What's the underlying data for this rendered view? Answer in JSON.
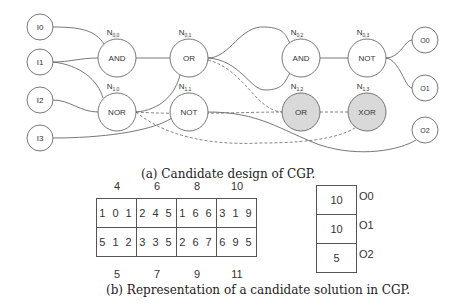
{
  "diagram": {
    "inputs": [
      {
        "label": "I0",
        "x": 40,
        "y": 27
      },
      {
        "label": "I1",
        "x": 40,
        "y": 62
      },
      {
        "label": "I2",
        "x": 40,
        "y": 100
      },
      {
        "label": "I3",
        "x": 40,
        "y": 138
      }
    ],
    "nodes": [
      {
        "id": "N0,0",
        "sub": "0,0",
        "func": "AND",
        "x": 117,
        "y": 58,
        "active": false
      },
      {
        "id": "N0,1",
        "sub": "0,1",
        "func": "OR",
        "x": 189,
        "y": 58,
        "active": false
      },
      {
        "id": "N0,2",
        "sub": "0,2",
        "func": "AND",
        "x": 301,
        "y": 58,
        "active": false
      },
      {
        "id": "N0,3",
        "sub": "0,3",
        "func": "NOT",
        "x": 367,
        "y": 58,
        "active": false
      },
      {
        "id": "N1,0",
        "sub": "1,0",
        "func": "NOR",
        "x": 117,
        "y": 112,
        "active": false
      },
      {
        "id": "N1,1",
        "sub": "1,1",
        "func": "NOT",
        "x": 189,
        "y": 112,
        "active": false
      },
      {
        "id": "N1,2",
        "sub": "1,2",
        "func": "OR",
        "x": 301,
        "y": 112,
        "active": true
      },
      {
        "id": "N1,3",
        "sub": "1,3",
        "func": "XOR",
        "x": 367,
        "y": 112,
        "active": true
      }
    ],
    "outputs": [
      {
        "label": "O0",
        "x": 425,
        "y": 40
      },
      {
        "label": "O1",
        "x": 425,
        "y": 88
      },
      {
        "label": "O2",
        "x": 425,
        "y": 130
      }
    ],
    "colors": {
      "stroke": "#555555",
      "inactive_fill": "#d9d9d9",
      "text": "#333333"
    }
  },
  "caption_a": "(a) Candidate design of CGP.",
  "genome": {
    "top_labels": [
      "4",
      "6",
      "8",
      "10"
    ],
    "rows": [
      [
        "1 0 1",
        "2 4 5",
        "1 6 6",
        "3 1 9"
      ],
      [
        "5 1 2",
        "3 3 5",
        "2 6 7",
        "6 9 5"
      ]
    ],
    "bottom_labels": [
      "5",
      "7",
      "9",
      "11"
    ]
  },
  "output_genes": [
    {
      "value": "10",
      "label": "O0"
    },
    {
      "value": "10",
      "label": "O1"
    },
    {
      "value": "5",
      "label": "O2"
    }
  ],
  "caption_b": "(b) Representation of a candidate solution in CGP."
}
